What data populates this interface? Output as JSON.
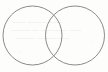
{
  "canvas": {
    "width": 108,
    "height": 72,
    "background_color": "#fdfdfc",
    "description": "Scanned page fragment showing two overlapping outline circles (Venn diagram / vesica piscis) with faint illegible show-through text behind them."
  },
  "figure": {
    "name": "two-overlapping-circles",
    "type": "venn-diagram",
    "stroke_color": "#8a8a8a",
    "stroke_width": 1,
    "fill": "none",
    "circles": [
      {
        "id": "left-circle",
        "center_x": 32.5,
        "center_y": 35.5,
        "radius": 29.5,
        "label": ""
      },
      {
        "id": "right-circle",
        "center_x": 75.0,
        "center_y": 35.5,
        "radius": 29.5,
        "label": ""
      }
    ],
    "intersection": {
      "id": "lens-region",
      "upper_crossing_x": 54,
      "upper_crossing_y": 11,
      "lower_crossing_x": 54,
      "lower_crossing_y": 60,
      "label": ""
    }
  },
  "bleed_through": {
    "visible": true,
    "legible": false,
    "color": "#b9b4b0",
    "note": "Illegible text show-through from the reverse side of the sheet",
    "lines": [
      "—— ——— ——",
      "——— — ———— ——",
      "——— —————"
    ]
  }
}
